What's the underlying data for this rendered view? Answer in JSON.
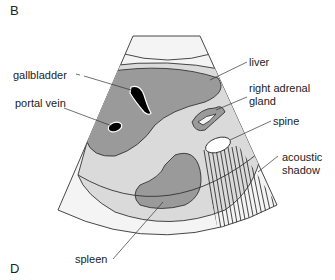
{
  "figure": {
    "panel_top": "B",
    "panel_bottom": "D",
    "colors": {
      "near_field": "#f3f3f3",
      "far_field": "#f2f2f2",
      "tissue": "#dadada",
      "organ": "#9a9a9a",
      "fluid": "#000000",
      "echogenic": "#ffffff",
      "outline": "#333333"
    },
    "labels": {
      "gallbladder": "gallbladder",
      "portal_vein": "portal vein",
      "liver": "liver",
      "right_adrenal_line1": "right adrenal",
      "right_adrenal_line2": "gland",
      "spine": "spine",
      "acoustic_shadow_line1": "acoustic",
      "acoustic_shadow_line2": "shadow",
      "spleen": "spleen"
    }
  }
}
